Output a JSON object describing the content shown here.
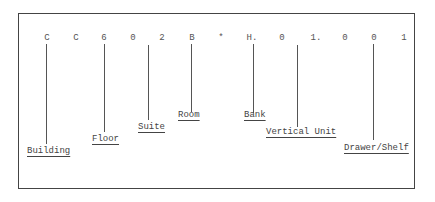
{
  "diagram": {
    "title": "",
    "code_characters": [
      {
        "char": "C",
        "x": 47
      },
      {
        "char": "C",
        "x": 76
      },
      {
        "char": "6",
        "x": 104
      },
      {
        "char": "0",
        "x": 133
      },
      {
        "char": "2",
        "x": 162
      },
      {
        "char": "B",
        "x": 192
      },
      {
        "char": "*",
        "x": 221
      },
      {
        "char": "H.",
        "x": 252
      },
      {
        "char": "0",
        "x": 282
      },
      {
        "char": "1.",
        "x": 316
      },
      {
        "char": "0",
        "x": 345
      },
      {
        "char": "0",
        "x": 374
      },
      {
        "char": "1",
        "x": 404
      }
    ],
    "labels": [
      {
        "text": "Building",
        "x": 27,
        "y": 146,
        "line_x": 46,
        "line_top": 44,
        "line_bottom": 144
      },
      {
        "text": "Floor",
        "x": 92,
        "y": 134,
        "line_x": 104,
        "line_top": 44,
        "line_bottom": 132
      },
      {
        "text": "Suite",
        "x": 138,
        "y": 122,
        "line_x": 148,
        "line_top": 45,
        "line_bottom": 120
      },
      {
        "text": "Room",
        "x": 178,
        "y": 110,
        "line_x": 191,
        "line_top": 44,
        "line_bottom": 112
      },
      {
        "text": "Bank",
        "x": 244,
        "y": 110,
        "line_x": 253,
        "line_top": 44,
        "line_bottom": 113
      },
      {
        "text": "Vertical Unit",
        "x": 266,
        "y": 127,
        "line_x": 297,
        "line_top": 45,
        "line_bottom": 127
      },
      {
        "text": "Drawer/Shelf",
        "x": 344,
        "y": 143,
        "line_x": 373,
        "line_top": 44,
        "line_bottom": 140
      }
    ]
  }
}
